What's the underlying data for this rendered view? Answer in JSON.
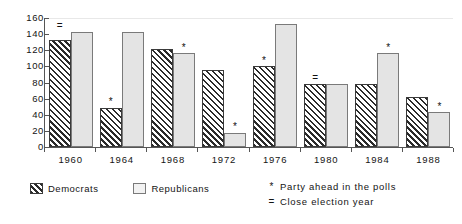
{
  "chart_data": {
    "type": "bar",
    "title": "",
    "xlabel": "",
    "ylabel": "",
    "categories": [
      "1960",
      "1964",
      "1968",
      "1972",
      "1976",
      "1980",
      "1984",
      "1988"
    ],
    "series": [
      {
        "name": "Democrats",
        "values": [
          133,
          49,
          121,
          96,
          101,
          78,
          78,
          62
        ]
      },
      {
        "name": "Republicans",
        "values": [
          143,
          143,
          117,
          18,
          152,
          78,
          117,
          43
        ]
      }
    ],
    "ylim": [
      0,
      160
    ],
    "ytick_values": [
      0,
      20,
      40,
      60,
      80,
      100,
      120,
      140,
      160
    ],
    "ytick_labels": [
      "0",
      "20",
      "40",
      "60",
      "80",
      "100",
      "120",
      "140",
      "160"
    ],
    "grid": false,
    "legend_position": "bottom-left",
    "annotations": [
      {
        "category": "1960",
        "symbol": "=",
        "meaning": "Close election year"
      },
      {
        "category": "1964",
        "series": "Democrats",
        "symbol": "*",
        "meaning": "Party ahead in the polls"
      },
      {
        "category": "1968",
        "series": "Republicans",
        "symbol": "*",
        "meaning": "Party ahead in the polls"
      },
      {
        "category": "1972",
        "series": "Republicans",
        "symbol": "*",
        "meaning": "Party ahead in the polls"
      },
      {
        "category": "1976",
        "series": "Democrats",
        "symbol": "*",
        "meaning": "Party ahead in the polls"
      },
      {
        "category": "1980",
        "symbol": "=",
        "meaning": "Close election year"
      },
      {
        "category": "1984",
        "series": "Republicans",
        "symbol": "*",
        "meaning": "Party ahead in the polls"
      },
      {
        "category": "1988",
        "series": "Republicans",
        "symbol": "*",
        "meaning": "Party ahead in the polls"
      }
    ]
  },
  "legend": {
    "items": [
      {
        "label": "Democrats",
        "pattern": "diagonal-hatch",
        "color": "#2b2b2b"
      },
      {
        "label": "Republicans",
        "pattern": "solid-light",
        "color": "#e4e4e4"
      }
    ]
  },
  "notes": [
    {
      "symbol": "*",
      "text": "Party ahead in the polls"
    },
    {
      "symbol": "=",
      "text": "Close election year"
    }
  ],
  "axis": {
    "y_labels": [
      "160",
      "140",
      "120",
      "100",
      "80",
      "60",
      "40",
      "20",
      "0"
    ],
    "x_labels": [
      "1960",
      "1964",
      "1968",
      "1972",
      "1976",
      "1980",
      "1984",
      "1988"
    ]
  }
}
